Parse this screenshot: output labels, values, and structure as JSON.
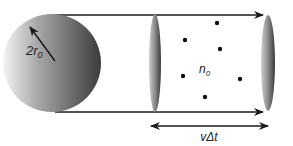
{
  "diagram": {
    "labels": {
      "radius": "2r",
      "radius_sub": "0",
      "density": "n",
      "density_sub": "0",
      "length": "vΔt"
    },
    "particle_count": 6,
    "colors": {
      "line": "#1a1a1a",
      "sphere_light": "#f2f2f2",
      "sphere_dark": "#3a3a3a",
      "ellipse_light": "#c8c8c8",
      "ellipse_dark": "#4a4a4a",
      "dot": "#111111"
    }
  }
}
